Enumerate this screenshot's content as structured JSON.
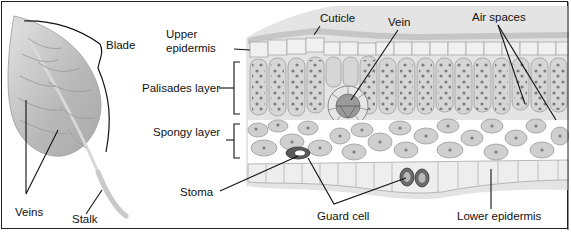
{
  "diagram": {
    "leaf_labels": {
      "blade": "Blade",
      "veins": "Veins",
      "stalk": "Stalk"
    },
    "cross_section_labels": {
      "cuticle": "Cuticle",
      "vein": "Vein",
      "air_spaces": "Air spaces",
      "upper_epidermis_line1": "Upper",
      "upper_epidermis_line2": "epidermis",
      "palisades_layer": "Palisades layer",
      "spongy_layer": "Spongy layer",
      "stoma": "Stoma",
      "guard_cell": "Guard cell",
      "lower_epidermis": "Lower epidermis"
    },
    "colors": {
      "leaf_fill": "#b9b9b9",
      "cell_fill": "#d4d4d4",
      "chloroplast": "#7a7a7a",
      "epidermis_fill": "#e8e8e8",
      "cuticle": "#c8c8c8",
      "guard_cell": "#5a5a5a",
      "line": "#111111"
    }
  }
}
